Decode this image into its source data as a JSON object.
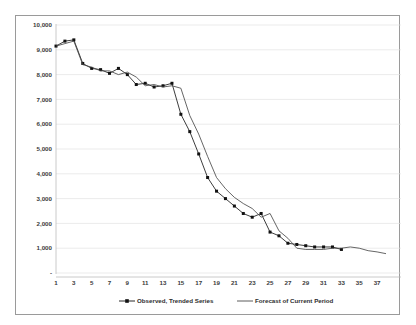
{
  "chart_data": {
    "type": "line",
    "title": "",
    "xlabel": "",
    "ylabel": "",
    "ylim": [
      0,
      10000
    ],
    "xlim": [
      1,
      38
    ],
    "grid": true,
    "legend_position": "bottom",
    "y_ticks": [
      {
        "value": 10000,
        "label": "10,000"
      },
      {
        "value": 9000,
        "label": "9,000"
      },
      {
        "value": 8000,
        "label": "8,000"
      },
      {
        "value": 7000,
        "label": "7,000"
      },
      {
        "value": 6000,
        "label": "6,000"
      },
      {
        "value": 5000,
        "label": "5,000"
      },
      {
        "value": 4000,
        "label": "4,000"
      },
      {
        "value": 3000,
        "label": "3,000"
      },
      {
        "value": 2000,
        "label": "2,000"
      },
      {
        "value": 1000,
        "label": "1,000"
      },
      {
        "value": 0,
        "label": "-"
      }
    ],
    "x_ticks": [
      {
        "value": 1,
        "label": "1"
      },
      {
        "value": 3,
        "label": "3"
      },
      {
        "value": 5,
        "label": "5"
      },
      {
        "value": 7,
        "label": "7"
      },
      {
        "value": 9,
        "label": "9"
      },
      {
        "value": 11,
        "label": "11"
      },
      {
        "value": 13,
        "label": "13"
      },
      {
        "value": 15,
        "label": "15"
      },
      {
        "value": 17,
        "label": "17"
      },
      {
        "value": 19,
        "label": "19"
      },
      {
        "value": 21,
        "label": "21"
      },
      {
        "value": 23,
        "label": "23"
      },
      {
        "value": 25,
        "label": "25"
      },
      {
        "value": 27,
        "label": "27"
      },
      {
        "value": 29,
        "label": "29"
      },
      {
        "value": 31,
        "label": "31"
      },
      {
        "value": 33,
        "label": "33"
      },
      {
        "value": 35,
        "label": "35"
      },
      {
        "value": 37,
        "label": "37"
      }
    ],
    "series": [
      {
        "name": "Observed, Trended Series",
        "style": "line-with-markers",
        "color": "#111111",
        "x": [
          1,
          2,
          3,
          4,
          5,
          6,
          7,
          8,
          9,
          10,
          11,
          12,
          13,
          14,
          15,
          16,
          17,
          18,
          19,
          20,
          21,
          22,
          23,
          24,
          25,
          26,
          27,
          28,
          29,
          30,
          31,
          32,
          33
        ],
        "values": [
          9150,
          9350,
          9400,
          8450,
          8250,
          8200,
          8050,
          8250,
          8000,
          7600,
          7650,
          7500,
          7550,
          7650,
          6400,
          5700,
          4800,
          3850,
          3300,
          3000,
          2700,
          2400,
          2250,
          2400,
          1650,
          1500,
          1200,
          1150,
          1100,
          1050,
          1050,
          1050,
          950
        ]
      },
      {
        "name": "Forecast of Current Period",
        "style": "line",
        "color": "#4a4a4a",
        "x": [
          1,
          2,
          3,
          4,
          5,
          6,
          7,
          8,
          9,
          10,
          11,
          12,
          13,
          14,
          15,
          16,
          17,
          18,
          19,
          20,
          21,
          22,
          23,
          24,
          25,
          26,
          27,
          28,
          29,
          30,
          31,
          32,
          33,
          34,
          35,
          36,
          37,
          38
        ],
        "values": [
          9150,
          9250,
          9350,
          8400,
          8300,
          8150,
          8150,
          8000,
          8100,
          7900,
          7550,
          7600,
          7500,
          7550,
          7450,
          6350,
          5600,
          4700,
          3850,
          3400,
          3050,
          2800,
          2600,
          2250,
          2400,
          1700,
          1400,
          1000,
          950,
          950,
          950,
          1000,
          1000,
          1050,
          1000,
          900,
          850,
          780
        ]
      }
    ]
  },
  "legend": {
    "entries": [
      {
        "label": "Observed, Trended Series",
        "marker": "square",
        "color": "#111111"
      },
      {
        "label": "Forecast of Current Period",
        "marker": "none",
        "color": "#4a4a4a"
      }
    ]
  }
}
